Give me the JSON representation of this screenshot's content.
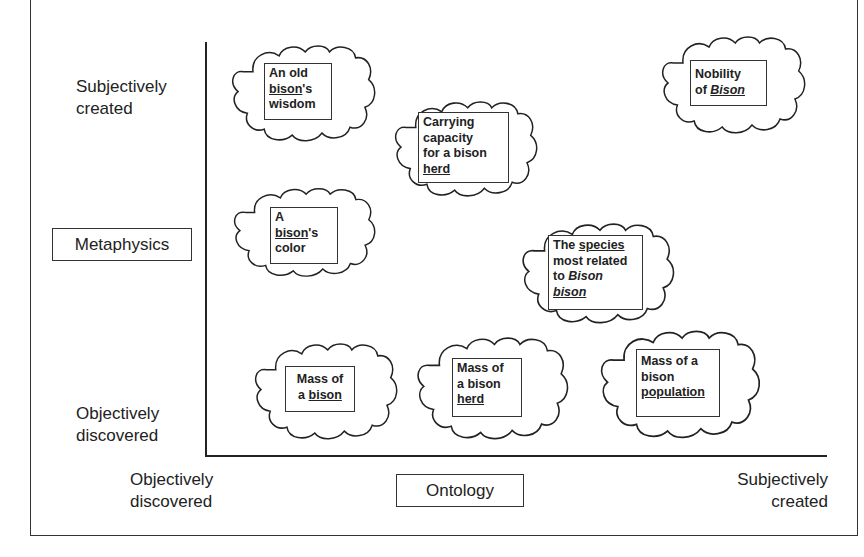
{
  "diagram": {
    "y_axis": {
      "label": "Metaphysics",
      "top": "Subjectively created",
      "top_lines": [
        "Subjectively",
        "created"
      ],
      "bottom_lines": [
        "Objectively",
        "discovered"
      ]
    },
    "x_axis": {
      "label": "Ontology",
      "left_lines": [
        "Objectively",
        "discovered"
      ],
      "right_lines": [
        "Subjectively",
        "created"
      ]
    },
    "clouds": [
      {
        "id": "old-bison-wisdom",
        "text": "An old bison's wisdom",
        "parts": {
          "l1": "An old",
          "l2a": "bison",
          "l2b": "'s",
          "l3": "wisdom"
        }
      },
      {
        "id": "carrying-capacity",
        "text": "Carrying capacity for a bison herd",
        "parts": {
          "l1": "Carrying",
          "l2": "capacity",
          "l3": "for a bison",
          "l4": "herd"
        }
      },
      {
        "id": "nobility-of-bison",
        "text": "Nobility of Bison",
        "parts": {
          "l1": "Nobility",
          "l2a": "of ",
          "l2b": "Bison"
        }
      },
      {
        "id": "bison-color",
        "text": "A bison's color",
        "parts": {
          "l1": "A",
          "l2a": "bison",
          "l2b": "'s",
          "l3": "color"
        }
      },
      {
        "id": "species-related",
        "text": "The species most related to Bison bison",
        "parts": {
          "l1a": "The ",
          "l1b": "species",
          "l2": "most related",
          "l3a": "to ",
          "l3b": "Bison",
          "l4": "bison"
        }
      },
      {
        "id": "mass-of-bison",
        "text": "Mass of a bison",
        "parts": {
          "l1": "Mass of",
          "l2a": "a ",
          "l2b": "bison"
        }
      },
      {
        "id": "mass-of-herd",
        "text": "Mass of a bison herd",
        "parts": {
          "l1": "Mass of",
          "l2": "a bison",
          "l3": "herd"
        }
      },
      {
        "id": "mass-of-population",
        "text": "Mass of a bison population",
        "parts": {
          "l1": "Mass of a",
          "l2": "bison",
          "l3": "population"
        }
      }
    ]
  }
}
